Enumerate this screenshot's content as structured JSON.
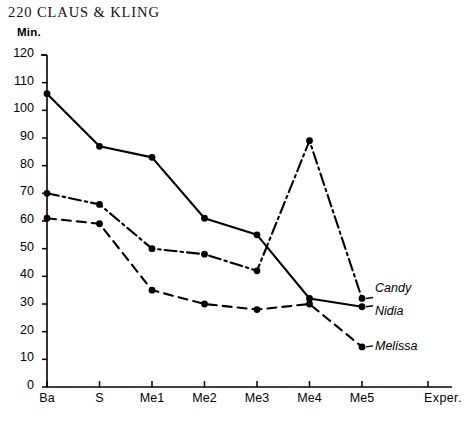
{
  "header": {
    "page_number": "220",
    "running_title": "CLAUS & KLING",
    "full_text": "220  CLAUS & KLING"
  },
  "chart_data": {
    "type": "line",
    "title": "",
    "xlabel": "Exper.",
    "ylabel": "Min.",
    "categories": [
      "Ba",
      "S",
      "Me1",
      "Me2",
      "Me3",
      "Me4",
      "Me5"
    ],
    "ylim": [
      0,
      120
    ],
    "ytick_labels": [
      "0",
      "10",
      "20",
      "30",
      "40",
      "50",
      "60",
      "70",
      "80",
      "90",
      "100",
      "110",
      "120"
    ],
    "ytick_values": [
      0,
      10,
      20,
      30,
      40,
      50,
      60,
      70,
      80,
      90,
      100,
      110,
      120
    ],
    "grid": false,
    "legend_position": "inline-right-of-last-point",
    "series": [
      {
        "name": "Nidia",
        "line_style": "solid",
        "marker": "filled-circle",
        "values": [
          106,
          87,
          83,
          61,
          55,
          32,
          29
        ]
      },
      {
        "name": "Candy",
        "line_style": "dash-dot",
        "marker": "filled-circle",
        "values": [
          70,
          66,
          50,
          48,
          42,
          89,
          32
        ]
      },
      {
        "name": "Melissa",
        "line_style": "dashed",
        "marker": "filled-circle",
        "values": [
          61,
          59,
          35,
          30,
          28,
          30,
          14.5
        ]
      }
    ],
    "colors": {
      "ink": "#000000",
      "background": "#ffffff"
    }
  }
}
